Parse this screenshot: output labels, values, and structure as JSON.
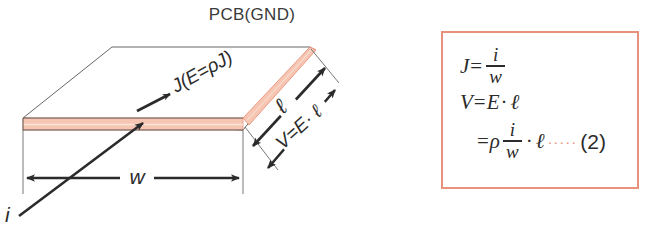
{
  "figure": {
    "title": "PCB(GND)",
    "background_color": "#ffffff",
    "copper_color": "#f6c6b2",
    "copper_edge_color": "#e8927c",
    "line_color": "#2b2b2b",
    "outline_color": "#555555"
  },
  "diagram": {
    "title_label": "PCB(GND)",
    "current_label": "i",
    "width_label": "w",
    "length_label": "ℓ",
    "voltage_label": "V=E· ℓ",
    "current_density_label": "J(E=ρJ)"
  },
  "formula_box": {
    "border_color": "#e8927c",
    "lines": [
      {
        "id": "line1",
        "lhs": "J",
        "equals": "=",
        "numerator": "i",
        "denominator": "w"
      },
      {
        "id": "line2",
        "lhs": "V",
        "equals": "=",
        "rhs_symbol": "E",
        "dot": "·",
        "tail": "ℓ"
      },
      {
        "id": "line3",
        "equals": "=",
        "rho": "ρ",
        "numerator": "i",
        "denominator": "w",
        "dot": "·",
        "tail": "ℓ",
        "leader": "·····",
        "number": "(2)"
      }
    ]
  }
}
